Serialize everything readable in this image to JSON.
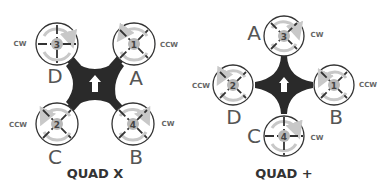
{
  "colors": {
    "frame": "#2a2a2a",
    "ring": "#333333",
    "rotation_arrow": "#c8c8c8",
    "hub": "#b8b8b8",
    "label": "#555555",
    "direction_text": "#666666",
    "title": "#333333"
  },
  "diagrams": [
    {
      "title": "QUAD X",
      "frame_icon": "forward-arrow-icon",
      "motors": [
        {
          "number": "3",
          "position": "D",
          "rotation": "CW"
        },
        {
          "number": "1",
          "position": "A",
          "rotation": "CCW"
        },
        {
          "number": "2",
          "position": "C",
          "rotation": "CCW"
        },
        {
          "number": "4",
          "position": "B",
          "rotation": "CW"
        }
      ]
    },
    {
      "title": "QUAD +",
      "frame_icon": "forward-arrow-icon",
      "motors": [
        {
          "number": "3",
          "position": "A",
          "rotation": "CW"
        },
        {
          "number": "2",
          "position": "D",
          "rotation": "CCW"
        },
        {
          "number": "1",
          "position": "B",
          "rotation": "CCW"
        },
        {
          "number": "4",
          "position": "C",
          "rotation": "CW"
        }
      ]
    }
  ]
}
